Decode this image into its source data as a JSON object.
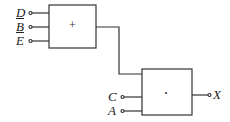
{
  "gate_or": {
    "symbol": "+",
    "inputs": [
      {
        "label": "D",
        "negated": false
      },
      {
        "label": "B",
        "negated": true
      },
      {
        "label": "E",
        "negated": true
      }
    ]
  },
  "gate_and": {
    "symbol": "·",
    "inputs": [
      {
        "label": "C",
        "negated": false
      },
      {
        "label": "A",
        "negated": false
      }
    ],
    "output": "X"
  }
}
